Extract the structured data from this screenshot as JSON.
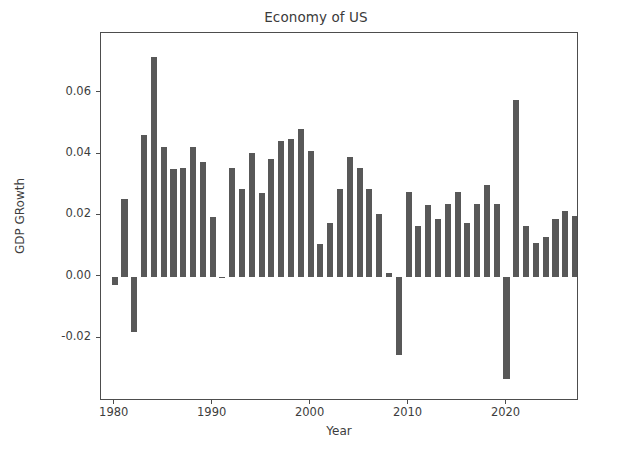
{
  "chart_data": {
    "type": "bar",
    "title": "Economy of US",
    "xlabel": "Year",
    "ylabel": "GDP GRowth",
    "grid": false,
    "legend": false,
    "legend_position": "none",
    "bar_color": "#585858",
    "xlim": [
      1978.6,
      2027.4
    ],
    "ylim": [
      -0.0405,
      0.0795
    ],
    "xticks": [
      1980,
      1990,
      2000,
      2010,
      2020
    ],
    "xtick_labels": [
      "1980",
      "1990",
      "2000",
      "2010",
      "2020"
    ],
    "yticks": [
      -0.02,
      0.0,
      0.02,
      0.04,
      0.06
    ],
    "ytick_labels": [
      "-0.02",
      "0.00",
      "0.02",
      "0.04",
      "0.06"
    ],
    "categories": [
      1980,
      1981,
      1982,
      1983,
      1984,
      1985,
      1986,
      1987,
      1988,
      1989,
      1990,
      1991,
      1992,
      1993,
      1994,
      1995,
      1996,
      1997,
      1998,
      1999,
      2000,
      2001,
      2002,
      2003,
      2004,
      2005,
      2006,
      2007,
      2008,
      2009,
      2010,
      2011,
      2012,
      2013,
      2014,
      2015,
      2016,
      2017,
      2018,
      2019,
      2020,
      2021,
      2022,
      2023,
      2024,
      2025,
      2026,
      2027
    ],
    "values": [
      -0.0026,
      0.0254,
      -0.018,
      0.0462,
      0.0718,
      0.0423,
      0.0353,
      0.0354,
      0.0423,
      0.0375,
      0.0194,
      -0.0002,
      0.0356,
      0.0285,
      0.0405,
      0.0274,
      0.0385,
      0.0444,
      0.0449,
      0.0481,
      0.0411,
      0.0106,
      0.0174,
      0.0287,
      0.0392,
      0.0354,
      0.0287,
      0.0205,
      0.0013,
      -0.0254,
      0.0277,
      0.0165,
      0.0235,
      0.0187,
      0.0237,
      0.0276,
      0.0175,
      0.0236,
      0.0299,
      0.0237,
      -0.0333,
      0.0576,
      0.0166,
      0.011,
      0.0129,
      0.0188,
      0.0216,
      0.0199
    ]
  }
}
